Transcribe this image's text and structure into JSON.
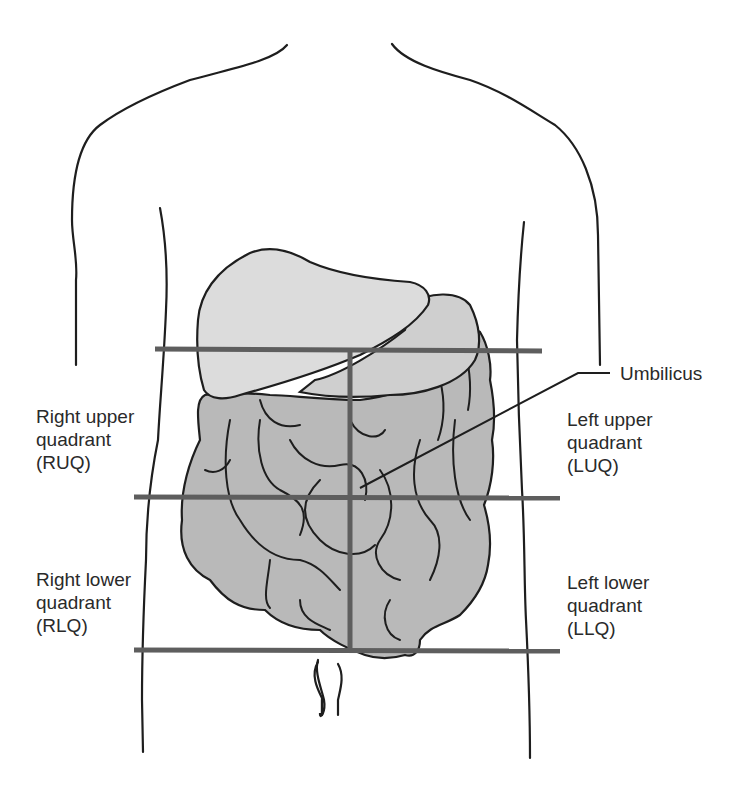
{
  "diagram": {
    "type": "anatomical-quadrants",
    "colors": {
      "outline": "#1e1e1e",
      "organ_fill_light": "#dcdcdc",
      "organ_fill_dark": "#b9b9b9",
      "quadrant_lines": "#5e5e5e",
      "text": "#2a2a2a",
      "background": "#ffffff"
    },
    "labels": {
      "umbilicus": "Umbilicus",
      "ruq": {
        "line1": "Right upper",
        "line2": "quadrant",
        "line3": "(RUQ)"
      },
      "luq": {
        "line1": "Left upper",
        "line2": "quadrant",
        "line3": "(LUQ)"
      },
      "rlq": {
        "line1": "Right lower",
        "line2": "quadrant",
        "line3": "(RLQ)"
      },
      "llq": {
        "line1": "Left lower",
        "line2": "quadrant",
        "line3": "(LLQ)"
      }
    }
  }
}
